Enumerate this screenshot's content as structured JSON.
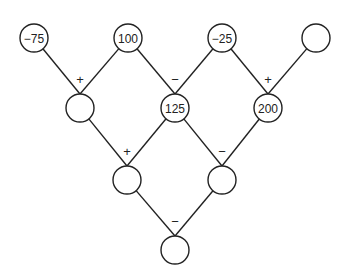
{
  "diagram": {
    "type": "number-pyramid",
    "rows": [
      {
        "nodes": [
          {
            "x": 34,
            "y": 38,
            "value": "−75"
          },
          {
            "x": 128,
            "y": 38,
            "value": "100"
          },
          {
            "x": 222,
            "y": 38,
            "value": "−25"
          },
          {
            "x": 316,
            "y": 38,
            "value": ""
          }
        ]
      },
      {
        "nodes": [
          {
            "x": 80,
            "y": 108,
            "value": ""
          },
          {
            "x": 175,
            "y": 108,
            "value": "125"
          },
          {
            "x": 268,
            "y": 108,
            "value": "200"
          }
        ]
      },
      {
        "nodes": [
          {
            "x": 127,
            "y": 180,
            "value": ""
          },
          {
            "x": 222,
            "y": 180,
            "value": ""
          }
        ]
      },
      {
        "nodes": [
          {
            "x": 175,
            "y": 250,
            "value": ""
          }
        ]
      }
    ],
    "operators": [
      {
        "row": 0,
        "symbols": [
          "+",
          "−",
          "+"
        ]
      },
      {
        "row": 1,
        "symbols": [
          "+",
          "−"
        ]
      },
      {
        "row": 2,
        "symbols": [
          "−"
        ]
      }
    ],
    "style": {
      "stroke": "#222222",
      "radius": 14
    }
  }
}
